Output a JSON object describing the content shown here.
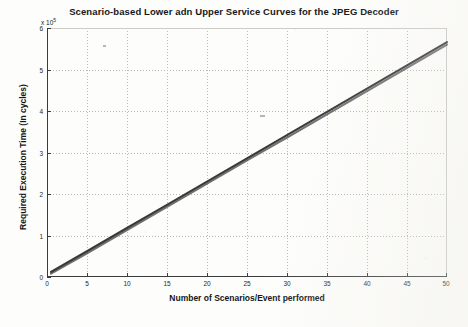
{
  "chart_data": {
    "type": "line",
    "title": "Scenario-based Lower adn Upper Service Curves for the JPEG Decoder",
    "xlabel": "Number of Scenarios/Event performed",
    "ylabel": "Required Execution Time (In cycles)",
    "y_axis_multiplier": "x 10",
    "y_axis_exponent": "5",
    "xlim": [
      0,
      50
    ],
    "ylim": [
      0,
      6
    ],
    "xticks": [
      0,
      5,
      10,
      15,
      20,
      25,
      30,
      35,
      40,
      45,
      50
    ],
    "yticks": [
      0,
      1,
      2,
      3,
      4,
      5,
      6
    ],
    "xticklabels": [
      "0",
      "5",
      "10",
      "15",
      "20",
      "25",
      "30",
      "35",
      "40",
      "45",
      "50"
    ],
    "yticklabels": [
      "0",
      "1",
      "2",
      "3",
      "4",
      "5",
      "6"
    ],
    "grid": true,
    "legend": "none",
    "series": [
      {
        "name": "Upper Service Curve",
        "color": "#2e2e31",
        "x": [
          0.5,
          5,
          10,
          15,
          20,
          25,
          30,
          35,
          40,
          45,
          50
        ],
        "values": [
          0.12,
          0.62,
          1.18,
          1.74,
          2.3,
          2.86,
          3.42,
          3.98,
          4.54,
          5.1,
          5.66
        ]
      },
      {
        "name": "Lower Service Curve",
        "color": "#414144",
        "x": [
          0.5,
          5,
          10,
          15,
          20,
          25,
          30,
          35,
          40,
          45,
          50
        ],
        "values": [
          0.08,
          0.57,
          1.13,
          1.69,
          2.25,
          2.81,
          3.36,
          3.92,
          4.48,
          5.04,
          5.6
        ]
      }
    ]
  },
  "figure": {
    "background_color": "#fdfdfb",
    "axis_color": "#3b3b3e",
    "grid_color": "#b9b9b5",
    "text_color": "#17171a"
  }
}
